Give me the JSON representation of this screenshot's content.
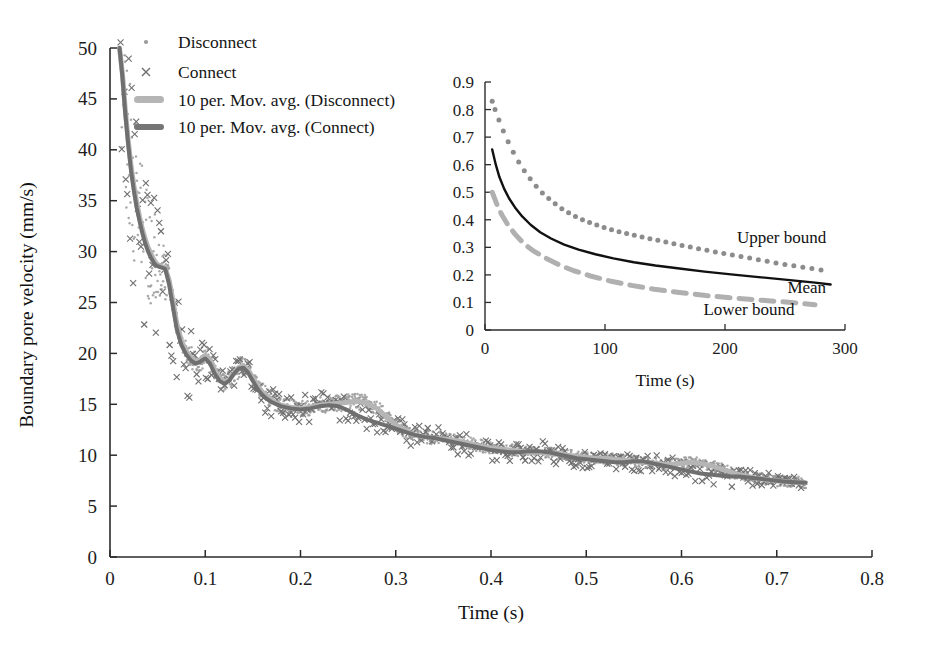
{
  "figure": {
    "title": "",
    "background_color": "#ffffff"
  },
  "chart_data": [
    {
      "id": "main",
      "type": "scatter",
      "title": "",
      "xlabel": "Time (s)",
      "ylabel": "Boundary pore velocity (mm/s)",
      "xlim": [
        0,
        0.8
      ],
      "ylim": [
        0,
        50
      ],
      "xticks": [
        0,
        0.1,
        0.2,
        0.3,
        0.4,
        0.5,
        0.6,
        0.7,
        0.8
      ],
      "xticklabels": [
        "0",
        "0.1",
        "0.2",
        "0.3",
        "0.4",
        "0.5",
        "0.6",
        "0.7",
        "0.8"
      ],
      "yticks": [
        0,
        5,
        10,
        15,
        20,
        25,
        30,
        35,
        40,
        45,
        50
      ],
      "yticklabels": [
        "0",
        "5",
        "10",
        "15",
        "20",
        "25",
        "30",
        "35",
        "40",
        "45",
        "50"
      ],
      "grid": false,
      "legend_position": "top-left",
      "legend": [
        {
          "label": "Disconnect",
          "marker": "dot",
          "color": "#8e8e8e"
        },
        {
          "label": "Connect",
          "marker": "cross",
          "color": "#6d6d6d"
        },
        {
          "label": "10 per. Mov. avg. (Disconnect)",
          "marker": "thick-line",
          "color": "#b3b3b3"
        },
        {
          "label": "10 per. Mov. avg. (Connect)",
          "marker": "thick-line",
          "color": "#757575"
        }
      ],
      "series": [
        {
          "name": "10 per. Mov. avg. (Disconnect)",
          "kind": "line",
          "color": "#b5b5b5",
          "width": 5.0,
          "x": [
            0.01,
            0.013,
            0.016,
            0.019,
            0.022,
            0.025,
            0.028,
            0.031,
            0.034,
            0.037,
            0.04,
            0.043,
            0.046,
            0.049,
            0.052,
            0.055,
            0.058,
            0.062,
            0.066,
            0.07,
            0.075,
            0.08,
            0.085,
            0.09,
            0.095,
            0.1,
            0.105,
            0.11,
            0.115,
            0.12,
            0.125,
            0.13,
            0.135,
            0.14,
            0.145,
            0.15,
            0.155,
            0.16,
            0.165,
            0.17,
            0.175,
            0.18,
            0.19,
            0.2,
            0.21,
            0.22,
            0.23,
            0.24,
            0.25,
            0.26,
            0.27,
            0.28,
            0.29,
            0.3,
            0.31,
            0.32,
            0.33,
            0.34,
            0.35,
            0.36,
            0.37,
            0.38,
            0.39,
            0.4,
            0.41,
            0.42,
            0.43,
            0.44,
            0.45,
            0.46,
            0.47,
            0.48,
            0.49,
            0.5,
            0.51,
            0.52,
            0.53,
            0.54,
            0.55,
            0.56,
            0.57,
            0.58,
            0.59,
            0.6,
            0.61,
            0.62,
            0.63,
            0.64,
            0.65,
            0.66,
            0.67,
            0.68,
            0.69,
            0.7,
            0.71,
            0.72,
            0.73
          ],
          "y": [
            50.0,
            47.5,
            44.0,
            41.0,
            38.5,
            36.5,
            34.8,
            33.4,
            32.2,
            31.2,
            30.4,
            29.8,
            29.2,
            28.8,
            28.6,
            28.5,
            28.4,
            27.2,
            25.2,
            23.0,
            21.2,
            20.2,
            19.6,
            19.2,
            19.4,
            19.8,
            19.4,
            18.4,
            17.6,
            17.2,
            17.4,
            18.0,
            18.6,
            18.8,
            18.4,
            17.6,
            16.8,
            16.2,
            15.8,
            15.4,
            15.1,
            14.9,
            14.7,
            14.6,
            14.7,
            14.9,
            15.0,
            15.1,
            15.2,
            15.3,
            15.1,
            14.6,
            13.8,
            13.0,
            12.4,
            12.0,
            11.8,
            11.7,
            11.6,
            11.5,
            11.3,
            11.1,
            10.9,
            10.7,
            10.6,
            10.5,
            10.4,
            10.3,
            10.3,
            10.2,
            10.1,
            10.0,
            9.9,
            9.8,
            9.7,
            9.7,
            9.6,
            9.5,
            9.4,
            9.3,
            9.2,
            9.1,
            9.1,
            9.2,
            9.3,
            9.2,
            9.0,
            8.7,
            8.4,
            8.1,
            7.9,
            7.7,
            7.6,
            7.5,
            7.4,
            7.35,
            7.3
          ]
        },
        {
          "name": "10 per. Mov. avg. (Connect)",
          "kind": "line",
          "color": "#6f6f6f",
          "width": 4.0,
          "x": [
            0.01,
            0.013,
            0.016,
            0.019,
            0.022,
            0.025,
            0.028,
            0.031,
            0.034,
            0.037,
            0.04,
            0.043,
            0.046,
            0.049,
            0.052,
            0.055,
            0.058,
            0.062,
            0.066,
            0.07,
            0.075,
            0.08,
            0.085,
            0.09,
            0.095,
            0.1,
            0.105,
            0.11,
            0.115,
            0.12,
            0.125,
            0.13,
            0.135,
            0.14,
            0.145,
            0.15,
            0.155,
            0.16,
            0.165,
            0.17,
            0.175,
            0.18,
            0.19,
            0.2,
            0.21,
            0.22,
            0.23,
            0.24,
            0.25,
            0.26,
            0.27,
            0.28,
            0.29,
            0.3,
            0.31,
            0.32,
            0.33,
            0.34,
            0.35,
            0.36,
            0.37,
            0.38,
            0.39,
            0.4,
            0.41,
            0.42,
            0.43,
            0.44,
            0.45,
            0.46,
            0.47,
            0.48,
            0.49,
            0.5,
            0.51,
            0.52,
            0.53,
            0.54,
            0.55,
            0.56,
            0.57,
            0.58,
            0.59,
            0.6,
            0.61,
            0.62,
            0.63,
            0.64,
            0.65,
            0.66,
            0.67,
            0.68,
            0.69,
            0.7,
            0.71,
            0.72,
            0.73
          ],
          "y": [
            50.0,
            47.2,
            43.6,
            40.6,
            38.0,
            36.0,
            34.3,
            33.0,
            31.8,
            30.8,
            30.0,
            29.4,
            28.9,
            28.6,
            28.5,
            28.4,
            28.3,
            26.8,
            24.6,
            22.4,
            20.8,
            19.9,
            19.3,
            19.0,
            19.2,
            19.5,
            19.0,
            18.0,
            17.3,
            17.0,
            17.3,
            18.0,
            18.5,
            18.6,
            18.1,
            17.3,
            16.5,
            15.9,
            15.5,
            15.2,
            15.0,
            14.8,
            14.6,
            14.5,
            14.6,
            14.8,
            14.9,
            14.8,
            14.4,
            13.9,
            13.5,
            13.2,
            12.9,
            12.6,
            12.3,
            12.0,
            11.8,
            11.7,
            11.5,
            11.3,
            11.1,
            10.9,
            10.7,
            10.5,
            10.4,
            10.3,
            10.3,
            10.4,
            10.4,
            10.3,
            10.1,
            9.9,
            9.7,
            9.6,
            9.5,
            9.4,
            9.3,
            9.3,
            9.4,
            9.4,
            9.2,
            9.0,
            8.8,
            8.6,
            8.4,
            8.2,
            8.1,
            8.0,
            7.9,
            7.9,
            7.8,
            7.7,
            7.6,
            7.5,
            7.4,
            7.35,
            7.3
          ]
        },
        {
          "name": "Disconnect",
          "kind": "markers",
          "marker": "dot",
          "color": "#9a9a9a",
          "note": "dense scatter cloud following the Disconnect moving average"
        },
        {
          "name": "Connect",
          "kind": "markers",
          "marker": "cross",
          "color": "#707070",
          "note": "scattered x markers with larger spread around the Connect moving average"
        }
      ]
    },
    {
      "id": "inset",
      "type": "line",
      "title": "",
      "xlabel": "Time (s)",
      "ylabel": "",
      "xlim": [
        0,
        300
      ],
      "ylim": [
        0,
        0.9
      ],
      "xticks": [
        0,
        100,
        200,
        300
      ],
      "xticklabels": [
        "0",
        "100",
        "200",
        "300"
      ],
      "yticks": [
        0,
        0.1,
        0.2,
        0.3,
        0.4,
        0.5,
        0.6,
        0.7,
        0.8,
        0.9
      ],
      "yticklabels": [
        "0",
        "0.1",
        "0.2",
        "0.3",
        "0.4",
        "0.5",
        "0.6",
        "0.7",
        "0.8",
        "0.9"
      ],
      "grid": false,
      "annotations": [
        {
          "text": "Upper bound",
          "x": 210,
          "y": 0.315
        },
        {
          "text": "Mean",
          "x": 252,
          "y": 0.135
        },
        {
          "text": "Lower bound",
          "x": 182,
          "y": 0.055
        }
      ],
      "series": [
        {
          "name": "Upper bound",
          "kind": "dotted",
          "color": "#8c8c8c",
          "x": [
            6,
            10,
            14,
            18,
            23,
            28,
            34,
            40,
            47,
            55,
            64,
            74,
            85,
            97,
            110,
            124,
            139,
            155,
            172,
            190,
            209,
            228,
            247,
            265,
            280
          ],
          "y": [
            0.83,
            0.78,
            0.735,
            0.695,
            0.65,
            0.61,
            0.57,
            0.535,
            0.5,
            0.47,
            0.44,
            0.415,
            0.393,
            0.375,
            0.358,
            0.344,
            0.33,
            0.315,
            0.3,
            0.285,
            0.27,
            0.255,
            0.24,
            0.228,
            0.218
          ]
        },
        {
          "name": "Mean",
          "kind": "solid",
          "color": "#111111",
          "x": [
            6,
            9,
            12,
            16,
            20,
            25,
            31,
            38,
            46,
            55,
            66,
            78,
            92,
            107,
            124,
            142,
            162,
            183,
            205,
            228,
            252,
            275,
            288
          ],
          "y": [
            0.655,
            0.6,
            0.555,
            0.512,
            0.478,
            0.445,
            0.412,
            0.382,
            0.355,
            0.332,
            0.31,
            0.292,
            0.275,
            0.26,
            0.246,
            0.234,
            0.223,
            0.212,
            0.202,
            0.192,
            0.182,
            0.172,
            0.165
          ]
        },
        {
          "name": "Lower bound",
          "kind": "dashed",
          "color": "#b0b0b0",
          "x": [
            6,
            10,
            14,
            19,
            25,
            32,
            40,
            50,
            61,
            74,
            88,
            104,
            122,
            141,
            162,
            184,
            207,
            231,
            255,
            275
          ],
          "y": [
            0.5,
            0.455,
            0.418,
            0.382,
            0.348,
            0.315,
            0.288,
            0.262,
            0.238,
            0.215,
            0.196,
            0.178,
            0.162,
            0.148,
            0.136,
            0.125,
            0.116,
            0.108,
            0.1,
            0.092
          ]
        }
      ]
    }
  ]
}
